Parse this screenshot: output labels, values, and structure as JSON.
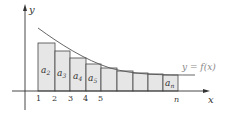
{
  "diagram": {
    "axes": {
      "x_label": "x",
      "y_label": "y"
    },
    "curve_label": "y = f(x)",
    "tick_labels": [
      "1",
      "2",
      "3",
      "4",
      "5",
      "n"
    ],
    "rect_labels": [
      {
        "base": "a",
        "sub": "2"
      },
      {
        "base": "a",
        "sub": "3"
      },
      {
        "base": "a",
        "sub": "4"
      },
      {
        "base": "a",
        "sub": "5"
      },
      {
        "base": "a",
        "sub": "n"
      }
    ],
    "colors": {
      "fill": "#e6e6e6",
      "stroke": "#444444",
      "curve": "#555555",
      "label": "#888888"
    }
  }
}
